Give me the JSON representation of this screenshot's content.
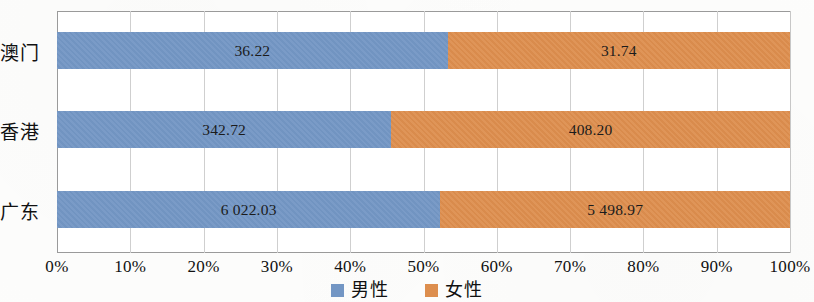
{
  "chart_data": {
    "type": "bar",
    "subtype": "stacked-bar-100-horizontal",
    "orientation": "horizontal",
    "title": "",
    "xlabel": "",
    "ylabel": "",
    "categories": [
      "澳门",
      "香港",
      "广东"
    ],
    "series": [
      {
        "name": "男性",
        "color": "#7396c4",
        "values": [
          36.22,
          342.72,
          6022.03
        ],
        "labels": [
          "36.22",
          "342.72",
          "6 022.03"
        ],
        "percents": [
          53.3,
          45.6,
          52.3
        ]
      },
      {
        "name": "女性",
        "color": "#dd8e4e",
        "values": [
          31.74,
          408.2,
          5498.97
        ],
        "labels": [
          "31.74",
          "408.20",
          "5 498.97"
        ],
        "percents": [
          46.7,
          54.4,
          47.7
        ]
      }
    ],
    "xticks": [
      "0%",
      "10%",
      "20%",
      "30%",
      "40%",
      "50%",
      "60%",
      "70%",
      "80%",
      "90%",
      "100%"
    ],
    "xtick_values": [
      0,
      10,
      20,
      30,
      40,
      50,
      60,
      70,
      80,
      90,
      100
    ],
    "xlim": [
      0,
      100
    ],
    "grid": true,
    "grid_axis": "x",
    "legend": {
      "position": "bottom-center",
      "entries": [
        {
          "label": "男性",
          "color": "#7396c4"
        },
        {
          "label": "女性",
          "color": "#dd8e4e"
        }
      ]
    }
  }
}
